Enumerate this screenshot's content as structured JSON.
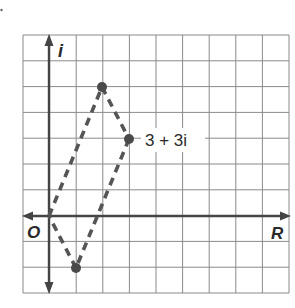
{
  "diagram": {
    "type": "complex-plane",
    "axes": {
      "horizontal_label": "R",
      "vertical_label": "i",
      "origin_label": "O"
    },
    "grid": {
      "columns": 10,
      "rows": 10,
      "x_min": -1,
      "x_max": 9,
      "y_min": -3,
      "y_max": 7
    },
    "points": [
      {
        "name": "origin",
        "re": 0,
        "im": 0
      },
      {
        "name": "top",
        "re": 2,
        "im": 5
      },
      {
        "name": "labeled",
        "re": 3,
        "im": 3,
        "label": "3 + 3i"
      },
      {
        "name": "bottom",
        "re": 1,
        "im": -2
      }
    ],
    "point_label": "3 + 3i",
    "colors": {
      "grid": "#8a8a8a",
      "axis": "#444444",
      "dash": "#555555",
      "point": "#4a4a4a"
    }
  }
}
